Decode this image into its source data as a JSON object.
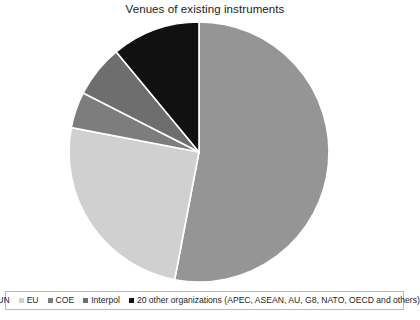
{
  "chart": {
    "title": "Venues of existing instruments"
  },
  "chart_data": {
    "type": "pie",
    "title": "Venues of existing instruments",
    "xlabel": "",
    "ylabel": "",
    "legend_position": "bottom",
    "grid": false,
    "labels": [
      "UN",
      "EU",
      "COE",
      "Interpol",
      "20 other organizations (APEC, ASEAN, AU, G8, NATO, OECD and others)"
    ],
    "values": [
      53,
      25,
      4.5,
      6.5,
      11
    ],
    "colors": [
      "#959595",
      "#d0d0d0",
      "#7d7d7d",
      "#6e6e6e",
      "#111111"
    ],
    "start_angle_deg": 0,
    "direction": "clockwise",
    "slices": [
      {
        "label": "UN",
        "value": 53,
        "color": "#959595",
        "start_deg": 0,
        "end_deg": 190.8
      },
      {
        "label": "EU",
        "value": 25,
        "color": "#d0d0d0",
        "start_deg": 190.8,
        "end_deg": 280.8
      },
      {
        "label": "COE",
        "value": 4.5,
        "color": "#7d7d7d",
        "start_deg": 280.8,
        "end_deg": 297.0
      },
      {
        "label": "Interpol",
        "value": 6.5,
        "color": "#6e6e6e",
        "start_deg": 297.0,
        "end_deg": 320.4
      },
      {
        "label": "20 other organizations (APEC, ASEAN, AU, G8, NATO, OECD and others)",
        "value": 11,
        "color": "#111111",
        "start_deg": 320.4,
        "end_deg": 360
      }
    ]
  },
  "legend": {
    "items": [
      {
        "label": "UN",
        "color": "#959595"
      },
      {
        "label": "EU",
        "color": "#d0d0d0"
      },
      {
        "label": "COE",
        "color": "#7d7d7d"
      },
      {
        "label": "Interpol",
        "color": "#6e6e6e"
      },
      {
        "label": "20 other organizations (APEC, ASEAN, AU, G8, NATO, OECD and others)",
        "color": "#111111"
      }
    ]
  }
}
